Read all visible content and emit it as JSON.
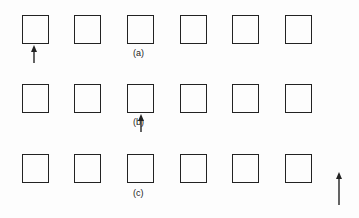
{
  "figure": {
    "rows": [
      {
        "label": "(a)",
        "top": 15,
        "label_x": 133,
        "label_y": 54,
        "arrow": {
          "x": 34,
          "y1": 45,
          "y2": 63
        }
      },
      {
        "label": "(b)",
        "top": 84,
        "label_x": 133,
        "label_y": 123,
        "arrow": {
          "x": 141,
          "y1": 114,
          "y2": 132
        }
      },
      {
        "label": "(c)",
        "top": 154,
        "label_x": 133,
        "label_y": 196,
        "arrow": {
          "x": 339,
          "y1": 172,
          "y2": 205
        }
      }
    ],
    "columns_x": [
      22,
      74,
      127,
      180,
      232,
      285
    ],
    "square_count_per_row": 6,
    "stroke_color": "#222222"
  }
}
